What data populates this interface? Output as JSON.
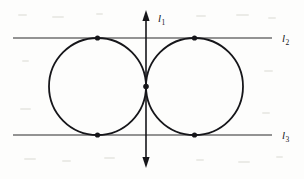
{
  "figure": {
    "width": 304,
    "height": 179,
    "background_color": "#fdfdfc",
    "ink_color": "#16161a",
    "line_color": "#2b2b2b"
  },
  "labels": {
    "l1": {
      "base": "l",
      "sub": "1",
      "x": 158,
      "y": 22
    },
    "l2": {
      "base": "l",
      "sub": "2",
      "x": 282,
      "y": 42
    },
    "l3": {
      "base": "l",
      "sub": "3",
      "x": 282,
      "y": 139
    }
  },
  "lines": [
    {
      "name": "l2",
      "kind": "horizontal",
      "x1": 13,
      "y1": 38,
      "x2": 272,
      "y2": 38,
      "stroke_width": 1.1,
      "arrow_start": false,
      "arrow_end": false
    },
    {
      "name": "l3",
      "kind": "horizontal",
      "x1": 13,
      "y1": 135,
      "x2": 272,
      "y2": 135,
      "stroke_width": 1.1,
      "arrow_start": false,
      "arrow_end": false
    },
    {
      "name": "l1",
      "kind": "vertical",
      "x1": 146,
      "y1": 10,
      "x2": 146,
      "y2": 168,
      "stroke_width": 1.6,
      "arrow_start": true,
      "arrow_end": true
    }
  ],
  "circles": [
    {
      "name": "left-circle",
      "cx": 97.5,
      "cy": 86.5,
      "r": 48.5,
      "stroke_width": 1.8
    },
    {
      "name": "right-circle",
      "cx": 194.5,
      "cy": 86.5,
      "r": 48.5,
      "stroke_width": 1.8
    }
  ],
  "points": [
    {
      "name": "tangent-point-left-top",
      "cx": 97.5,
      "cy": 38,
      "r": 2.6
    },
    {
      "name": "tangent-point-right-top",
      "cx": 194.5,
      "cy": 38,
      "r": 2.6
    },
    {
      "name": "tangent-point-left-bottom",
      "cx": 97.5,
      "cy": 135,
      "r": 2.6
    },
    {
      "name": "tangent-point-right-bottom",
      "cx": 194.5,
      "cy": 135,
      "r": 2.6
    },
    {
      "name": "tangent-point-circles",
      "cx": 146,
      "cy": 86.5,
      "r": 2.8
    }
  ],
  "specks": [
    {
      "x": 18,
      "y": 14,
      "w": 9,
      "h": 2
    },
    {
      "x": 52,
      "y": 16,
      "w": 12,
      "h": 2
    },
    {
      "x": 96,
      "y": 13,
      "w": 7,
      "h": 2
    },
    {
      "x": 196,
      "y": 15,
      "w": 10,
      "h": 2
    },
    {
      "x": 236,
      "y": 14,
      "w": 13,
      "h": 2
    },
    {
      "x": 268,
      "y": 17,
      "w": 8,
      "h": 2
    },
    {
      "x": 22,
      "y": 60,
      "w": 7,
      "h": 2
    },
    {
      "x": 264,
      "y": 70,
      "w": 9,
      "h": 2
    },
    {
      "x": 20,
      "y": 108,
      "w": 11,
      "h": 2
    },
    {
      "x": 262,
      "y": 112,
      "w": 8,
      "h": 2
    },
    {
      "x": 24,
      "y": 158,
      "w": 12,
      "h": 2
    },
    {
      "x": 62,
      "y": 160,
      "w": 9,
      "h": 2
    },
    {
      "x": 104,
      "y": 157,
      "w": 11,
      "h": 2
    },
    {
      "x": 196,
      "y": 159,
      "w": 8,
      "h": 2
    },
    {
      "x": 238,
      "y": 161,
      "w": 12,
      "h": 2
    },
    {
      "x": 276,
      "y": 156,
      "w": 7,
      "h": 2
    }
  ]
}
